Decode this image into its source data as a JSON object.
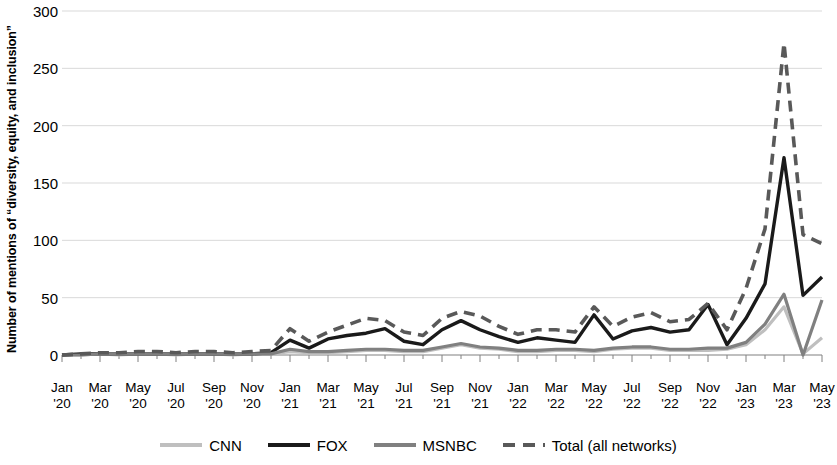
{
  "chart_data": {
    "type": "line",
    "title": "",
    "xlabel": "",
    "ylabel": "Number of mentions of “diversity, equity, and inclusion”",
    "ylim": [
      0,
      300
    ],
    "yticks": [
      0,
      50,
      100,
      150,
      200,
      250,
      300
    ],
    "ytick_labels": [
      "0",
      "50",
      "100",
      "150",
      "200",
      "250",
      "300"
    ],
    "grid": true,
    "legend_position": "bottom",
    "x_tick_months": [
      "Jan",
      "Mar",
      "May",
      "Jul",
      "Sep",
      "Nov",
      "Jan",
      "Mar",
      "May",
      "Jul",
      "Sep",
      "Nov",
      "Jan",
      "Mar",
      "May",
      "Jul",
      "Sep",
      "Nov",
      "Jan",
      "Mar",
      "May"
    ],
    "x_tick_years": [
      "'20",
      "'20",
      "'20",
      "'20",
      "'20",
      "'20",
      "'21",
      "'21",
      "'21",
      "'21",
      "'21",
      "'21",
      "'22",
      "'22",
      "'22",
      "'22",
      "'22",
      "'22",
      "'23",
      "'23",
      "'23"
    ],
    "x": [
      "Jan '20",
      "Feb '20",
      "Mar '20",
      "Apr '20",
      "May '20",
      "Jun '20",
      "Jul '20",
      "Aug '20",
      "Sep '20",
      "Oct '20",
      "Nov '20",
      "Dec '20",
      "Jan '21",
      "Feb '21",
      "Mar '21",
      "Apr '21",
      "May '21",
      "Jun '21",
      "Jul '21",
      "Aug '21",
      "Sep '21",
      "Oct '21",
      "Nov '21",
      "Dec '21",
      "Jan '22",
      "Feb '22",
      "Mar '22",
      "Apr '22",
      "May '22",
      "Jun '22",
      "Jul '22",
      "Aug '22",
      "Sep '22",
      "Oct '22",
      "Nov '22",
      "Dec '22",
      "Jan '23",
      "Feb '23",
      "Mar '23",
      "Apr '23",
      "May '23"
    ],
    "series": [
      {
        "name": "CNN",
        "color": "#BFBFBF",
        "style": "solid",
        "width": 3.2,
        "values": [
          0,
          0,
          1,
          0,
          1,
          1,
          0,
          1,
          1,
          0,
          1,
          1,
          3,
          2,
          2,
          3,
          4,
          4,
          3,
          3,
          6,
          9,
          6,
          5,
          3,
          3,
          4,
          4,
          3,
          5,
          6,
          6,
          4,
          4,
          4,
          5,
          9,
          22,
          42,
          1,
          15
        ]
      },
      {
        "name": "FOX",
        "color": "#1A1A1A",
        "style": "solid",
        "width": 3.4,
        "values": [
          0,
          1,
          1,
          1,
          1,
          1,
          1,
          1,
          1,
          1,
          1,
          2,
          13,
          6,
          14,
          17,
          19,
          23,
          12,
          9,
          22,
          30,
          22,
          16,
          11,
          15,
          13,
          11,
          35,
          14,
          21,
          24,
          20,
          22,
          44,
          9,
          32,
          62,
          172,
          52,
          68
        ]
      },
      {
        "name": "MSNBC",
        "color": "#808080",
        "style": "solid",
        "width": 3.2,
        "values": [
          0,
          0,
          1,
          1,
          1,
          1,
          1,
          1,
          1,
          1,
          1,
          1,
          5,
          3,
          3,
          4,
          5,
          5,
          4,
          4,
          7,
          10,
          7,
          6,
          4,
          4,
          5,
          5,
          4,
          6,
          7,
          7,
          5,
          5,
          6,
          6,
          11,
          27,
          53,
          0,
          48
        ]
      },
      {
        "name": "Total (all networks)",
        "color": "#595959",
        "style": "dashed",
        "width": 3.6,
        "values": [
          0,
          1,
          2,
          2,
          3,
          3,
          2,
          3,
          3,
          2,
          3,
          4,
          23,
          12,
          20,
          26,
          32,
          30,
          20,
          17,
          32,
          38,
          34,
          25,
          18,
          22,
          22,
          20,
          42,
          25,
          33,
          37,
          29,
          31,
          45,
          22,
          58,
          110,
          272,
          105,
          97
        ]
      }
    ]
  },
  "legend": {
    "items": [
      {
        "label": "CNN",
        "color": "#BFBFBF",
        "style": "solid"
      },
      {
        "label": "FOX",
        "color": "#1A1A1A",
        "style": "solid"
      },
      {
        "label": "MSNBC",
        "color": "#808080",
        "style": "solid"
      },
      {
        "label": "Total (all networks)",
        "color": "#595959",
        "style": "dashed"
      }
    ]
  },
  "axes": {
    "gridline_color": "#D9D9D9",
    "axis_color": "#808080"
  }
}
